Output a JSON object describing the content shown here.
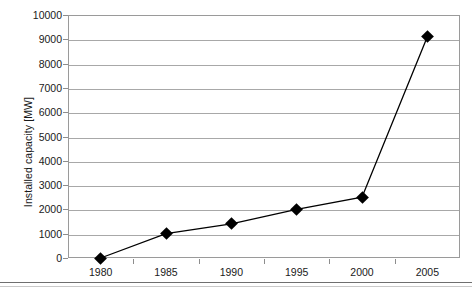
{
  "chart_data": {
    "type": "line",
    "title": "",
    "xlabel": "",
    "ylabel": "Installed capacity [MW]",
    "x": [
      1980,
      1985,
      1990,
      1995,
      2000,
      2005
    ],
    "categories": [
      "1980",
      "1985",
      "1990",
      "1995",
      "2000",
      "2005"
    ],
    "values": [
      0,
      1000,
      1400,
      2000,
      2500,
      9100
    ],
    "series": [
      {
        "name": "Installed capacity",
        "values": [
          0,
          1000,
          1400,
          2000,
          2500,
          9100
        ]
      }
    ],
    "xlim": [
      1977.5,
      2007.5
    ],
    "ylim": [
      0,
      10000
    ],
    "ytick_labels": [
      "0",
      "1000",
      "2000",
      "3000",
      "4000",
      "5000",
      "6000",
      "7000",
      "8000",
      "9000",
      "10000"
    ],
    "ytick_values": [
      0,
      1000,
      2000,
      3000,
      4000,
      5000,
      6000,
      7000,
      8000,
      9000,
      10000
    ],
    "xtick_labels": [
      "1980",
      "1985",
      "1990",
      "1995",
      "2000",
      "2005"
    ],
    "grid": "horizontal",
    "legend": "none",
    "marker": "diamond",
    "line_color": "#000000",
    "marker_color": "#000000",
    "grid_color": "#a8a8a8",
    "axis_color": "#9a9a9a",
    "background": "#ffffff"
  }
}
